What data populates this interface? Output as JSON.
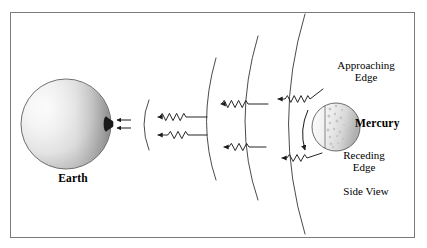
{
  "figure": {
    "frame_color": "#7a7a7a",
    "background": "#ffffff",
    "stroke_color": "#1a1a1a"
  },
  "bodies": {
    "earth": {
      "label": "Earth",
      "cx": 66,
      "cy": 124,
      "r": 45,
      "fill_light": "#fbfbfb",
      "fill_dark": "#8e8e8e",
      "outline": "#555555"
    },
    "mercury": {
      "label": "Mercury",
      "cx": 336,
      "cy": 127,
      "r": 24,
      "fill_light": "#f7f7f7",
      "fill_dark": "#b9b9b9",
      "outline": "#555555",
      "speckle_color": "#c9c9c9"
    }
  },
  "annotations": {
    "approaching_edge": "Approaching\nEdge",
    "receding_edge": "Receding\nEdge",
    "side_view": "Side View"
  },
  "antenna": {
    "name": "radar-dish",
    "x": 110,
    "y": 124
  },
  "wavefronts": {
    "count": 4,
    "description": "Nested circular arcs centered on Mercury expanding toward Earth",
    "radii": [
      48,
      120,
      180,
      236
    ],
    "stroke": "#2b2b2b"
  },
  "wave_arrows": {
    "count": 6,
    "direction": "leftward toward Earth",
    "description": "Sinusoidal radar echo rays travelling from Mercury to Earth"
  },
  "rotation_arrow": {
    "name": "mercury-rotation-arrow",
    "description": "Curved arrow indicating Mercury rotation from approaching to receding edge"
  },
  "receiver_arrows": {
    "count": 2,
    "description": "Short straight arrows entering the Earth radar dish"
  }
}
